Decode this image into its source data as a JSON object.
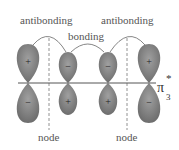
{
  "labels": {
    "antibonding_left": "antibonding",
    "antibonding_right": "antibonding",
    "bonding": "bonding",
    "node_left": "node",
    "node_right": "node",
    "orbital_symbol": "π",
    "orbital_superscript": "*",
    "orbital_subscript": "3"
  },
  "orbitals": [
    {
      "position": 1,
      "top_sign": "+",
      "bottom_sign": "−",
      "size": "large"
    },
    {
      "position": 2,
      "top_sign": "−",
      "bottom_sign": "+",
      "size": "small"
    },
    {
      "position": 3,
      "top_sign": "−",
      "bottom_sign": "+",
      "size": "small"
    },
    {
      "position": 4,
      "top_sign": "+",
      "bottom_sign": "−",
      "size": "large"
    }
  ],
  "colors": {
    "lobe_fill": "#7a7a7a",
    "lobe_highlight": "#9a9a9a",
    "line": "#555555",
    "text": "#555555"
  }
}
